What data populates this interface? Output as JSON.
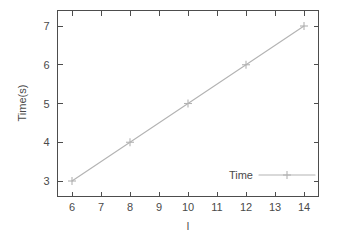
{
  "chart_data": {
    "type": "line",
    "title": "",
    "xlabel": "l",
    "ylabel": "Time(s)",
    "x": [
      6,
      8,
      10,
      12,
      14
    ],
    "series": [
      {
        "name": "Time",
        "values": [
          3,
          4,
          5,
          6,
          7
        ]
      }
    ],
    "xlim": [
      5.5,
      14.5
    ],
    "ylim": [
      2.6,
      7.4
    ],
    "xticks": [
      6,
      7,
      8,
      9,
      10,
      11,
      12,
      13,
      14
    ],
    "yticks": [
      3,
      4,
      5,
      6,
      7
    ],
    "xtick_labels": [
      "6",
      "7",
      "8",
      "9",
      "10",
      "11",
      "12",
      "13",
      "14"
    ],
    "ytick_labels": [
      "3",
      "4",
      "5",
      "6",
      "7"
    ],
    "grid": false,
    "legend_position": "lower-right-inside",
    "marker": "plus",
    "series_color": "#b3b3b3",
    "frame_color": "#4d4d4d",
    "text_color": "#4a4a4a",
    "background_color": "#ffffff"
  },
  "legend": {
    "entries": [
      {
        "label": "Time"
      }
    ]
  },
  "axes": {
    "x_title": "l",
    "y_title": "Time(s)"
  }
}
